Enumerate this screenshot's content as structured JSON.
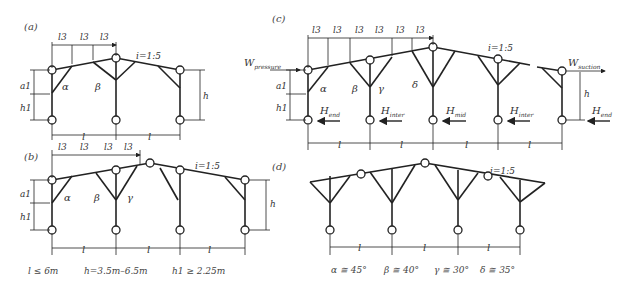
{
  "panels": {
    "a": {
      "label": "(a)",
      "slope": "i=1:5",
      "segment": "l",
      "sub_segment": "l3",
      "height": "h",
      "a1": "a1",
      "h1": "h1",
      "angles": [
        "α",
        "β"
      ]
    },
    "b": {
      "label": "(b)",
      "slope": "i=1:5",
      "segment": "l",
      "sub_segment": "l3",
      "height": "h",
      "a1": "a1",
      "h1": "h1",
      "angles": [
        "α",
        "β",
        "γ"
      ]
    },
    "c": {
      "label": "(c)",
      "slope": "i=1:5",
      "segment": "l",
      "sub_segment": "l3",
      "height": "h",
      "a1": "a1",
      "h1": "h1",
      "angles": [
        "α",
        "β",
        "γ",
        "δ"
      ],
      "wind_pressure": "W",
      "wind_pressure_sub": "pressure",
      "wind_suction": "W",
      "wind_suction_sub": "suction",
      "forces": [
        {
          "main": "H",
          "sub": "end"
        },
        {
          "main": "H",
          "sub": "inter"
        },
        {
          "main": "H",
          "sub": "mid"
        },
        {
          "main": "H",
          "sub": "inter"
        },
        {
          "main": "H",
          "sub": "end"
        }
      ]
    },
    "d": {
      "label": "(d)",
      "slope": "i=1:5",
      "segment": "l"
    }
  },
  "captions": {
    "left": [
      "l ≤ 6m",
      "h=3.5m–6.5m",
      "h1 ≥ 2.25m"
    ],
    "right": [
      "α ≅  45°",
      "β ≅  40°",
      "γ ≅  30°",
      "δ ≅  35°"
    ]
  }
}
